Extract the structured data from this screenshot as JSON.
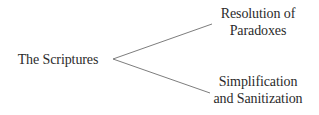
{
  "diagram": {
    "type": "tree-branch",
    "root": {
      "label": "The Scriptures"
    },
    "branches": [
      {
        "line1": "Resolution of",
        "line2": "Paradoxes"
      },
      {
        "line1": "Simplification",
        "line2": "and Sanitization"
      }
    ],
    "colors": {
      "text": "#2b2b2b",
      "line": "#6e6e6e",
      "background": "#ffffff"
    }
  }
}
